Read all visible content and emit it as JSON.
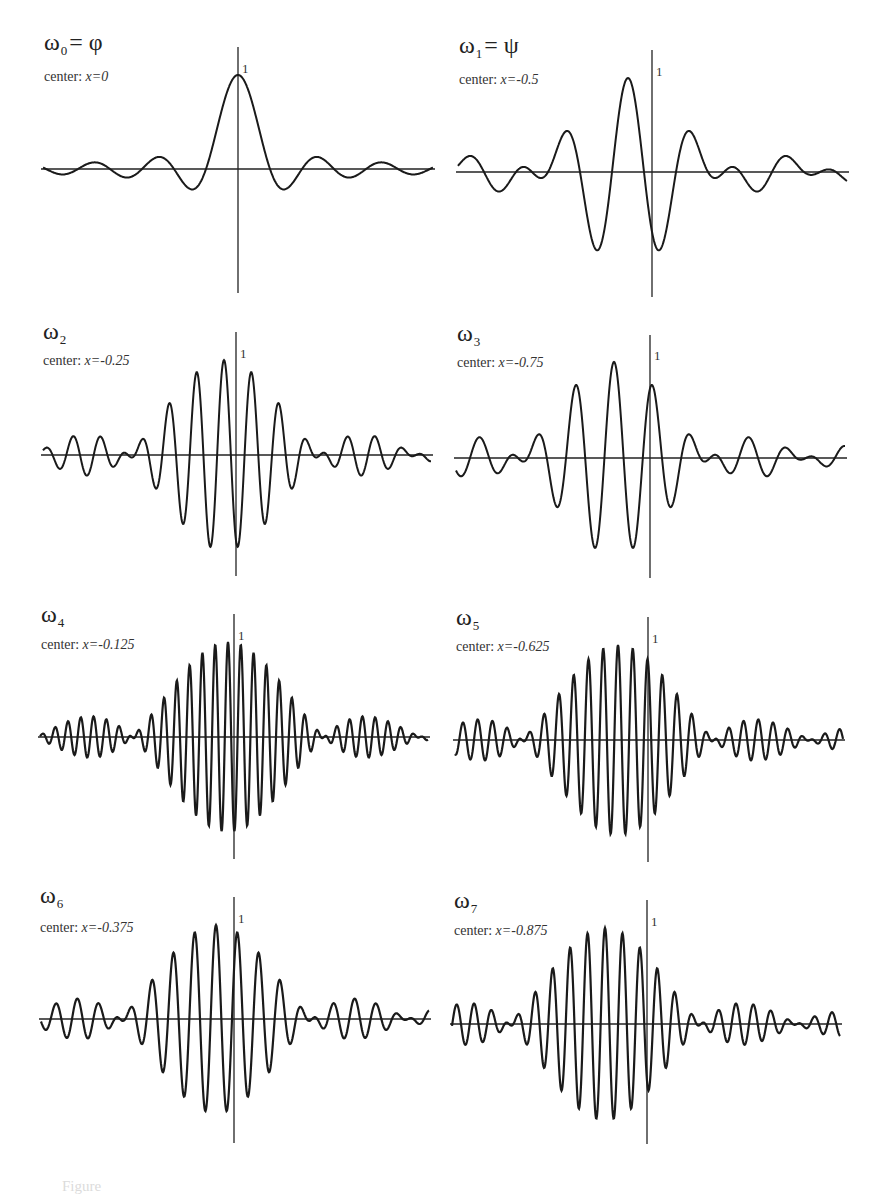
{
  "figure": {
    "layout": "4 rows x 2 columns of function plots",
    "caption_partial": "Figure"
  },
  "chart_data": [
    {
      "type": "line",
      "title": "ω0 = φ",
      "symbol": "ω",
      "index": "0",
      "equals": "= φ",
      "center_label": "center: ",
      "center_value": "x=0",
      "center_x": 0,
      "y_tick": "1",
      "band": [
        0,
        1
      ],
      "peak": 1.0
    },
    {
      "type": "line",
      "title": "ω1 = ψ",
      "symbol": "ω",
      "index": "1",
      "equals": "= ψ",
      "center_label": "center: ",
      "center_value": "x=-0.5",
      "center_x": -0.5,
      "y_tick": "1",
      "band": [
        1,
        2
      ],
      "peak": 1.0
    },
    {
      "type": "line",
      "title": "ω2",
      "symbol": "ω",
      "index": "2",
      "equals": "",
      "center_label": "center: ",
      "center_value": "x=-0.25",
      "center_x": -0.25,
      "y_tick": "1",
      "band": [
        3,
        4
      ],
      "peak": 1.0
    },
    {
      "type": "line",
      "title": "ω3",
      "symbol": "ω",
      "index": "3",
      "equals": "",
      "center_label": "center: ",
      "center_value": "x=-0.75",
      "center_x": -0.75,
      "y_tick": "1",
      "band": [
        2,
        3
      ],
      "peak": 1.0
    },
    {
      "type": "line",
      "title": "ω4",
      "symbol": "ω",
      "index": "4",
      "equals": "",
      "center_label": "center: ",
      "center_value": "x=-0.125",
      "center_x": -0.125,
      "y_tick": "1",
      "band": [
        7,
        8
      ],
      "peak": 1.0
    },
    {
      "type": "line",
      "title": "ω5",
      "symbol": "ω",
      "index": "5",
      "equals": "",
      "center_label": "center: ",
      "center_value": "x=-0.625",
      "center_x": -0.625,
      "y_tick": "1",
      "band": [
        6,
        7
      ],
      "peak": 1.0
    },
    {
      "type": "line",
      "title": "ω6",
      "symbol": "ω",
      "index": "6",
      "equals": "",
      "center_label": "center: ",
      "center_value": "x=-0.375",
      "center_x": -0.375,
      "y_tick": "1",
      "band": [
        4,
        5
      ],
      "peak": 1.0
    },
    {
      "type": "line",
      "title": "ω7",
      "symbol": "ω",
      "index": "7",
      "equals": "",
      "center_label": "center: ",
      "center_value": "x=-0.875",
      "center_x": -0.875,
      "y_tick": "1",
      "band": [
        5,
        6
      ],
      "peak": 1.0
    }
  ],
  "panels_geometry": [
    {
      "left": 43,
      "right": 433,
      "axis_y": 169,
      "vaxis_x": 238,
      "vtop": 47,
      "vbottom": 293,
      "peak_y": 75,
      "title_x": 44,
      "title_y": 52,
      "center_y": 82
    },
    {
      "left": 458,
      "right": 847,
      "axis_y": 172,
      "vaxis_x": 652,
      "vtop": 50,
      "vbottom": 297,
      "peak_y": 78,
      "title_x": 459,
      "title_y": 55,
      "center_y": 85
    },
    {
      "left": 43,
      "right": 431,
      "axis_y": 455,
      "vaxis_x": 236,
      "vtop": 332,
      "vbottom": 576,
      "peak_y": 360,
      "title_x": 43,
      "title_y": 341,
      "center_y": 366
    },
    {
      "left": 456,
      "right": 845,
      "axis_y": 458,
      "vaxis_x": 650,
      "vtop": 335,
      "vbottom": 578,
      "peak_y": 362,
      "title_x": 457,
      "title_y": 343,
      "center_y": 368
    },
    {
      "left": 40,
      "right": 428,
      "axis_y": 737,
      "vaxis_x": 234,
      "vtop": 614,
      "vbottom": 859,
      "peak_y": 642,
      "title_x": 41,
      "title_y": 624,
      "center_y": 650
    },
    {
      "left": 455,
      "right": 843,
      "axis_y": 740,
      "vaxis_x": 648,
      "vtop": 617,
      "vbottom": 862,
      "peak_y": 645,
      "title_x": 456,
      "title_y": 627,
      "center_y": 652
    },
    {
      "left": 41,
      "right": 429,
      "axis_y": 1019,
      "vaxis_x": 234,
      "vtop": 897,
      "vbottom": 1143,
      "peak_y": 925,
      "title_x": 40,
      "title_y": 905,
      "center_y": 933
    },
    {
      "left": 452,
      "right": 840,
      "axis_y": 1024,
      "vaxis_x": 647,
      "vtop": 900,
      "vbottom": 1144,
      "peak_y": 928,
      "title_x": 454,
      "title_y": 910,
      "center_y": 936
    }
  ],
  "style": {
    "stroke": "#1a1a1a",
    "axis": "#222222",
    "background": "#ffffff"
  }
}
